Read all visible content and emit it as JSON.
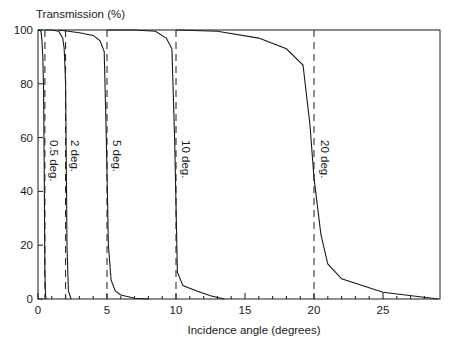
{
  "chart_data": {
    "type": "line",
    "title": "",
    "ylabel": "Transmission (%)",
    "xlabel": "Incidence angle (degrees)",
    "xlim": [
      0,
      29
    ],
    "ylim": [
      0,
      100
    ],
    "xticks": [
      0,
      5,
      10,
      15,
      20,
      25
    ],
    "yticks": [
      0,
      20,
      40,
      60,
      80,
      100
    ],
    "grid": false,
    "legend": "inline rotated labels next to dashed cutoff lines",
    "series": [
      {
        "name": "0.5 deg.",
        "cutoff": 0.5,
        "x": [
          0,
          0.1,
          0.2,
          0.25,
          0.3,
          0.35,
          0.4,
          0.45,
          0.5,
          0.55,
          0.6
        ],
        "y": [
          100,
          100,
          99.5,
          98,
          95,
          90,
          80,
          50,
          10,
          1,
          0
        ]
      },
      {
        "name": "2 deg.",
        "cutoff": 2,
        "x": [
          0.5,
          1.0,
          1.5,
          1.8,
          1.9,
          2.0,
          2.05,
          2.1,
          2.2,
          2.4
        ],
        "y": [
          100,
          100,
          99.5,
          97,
          93,
          80,
          50,
          20,
          3,
          0
        ]
      },
      {
        "name": "5 deg.",
        "cutoff": 5,
        "x": [
          1.5,
          3.0,
          4.0,
          4.5,
          4.8,
          4.95,
          5.1,
          5.3,
          5.6,
          6.0,
          7.0,
          8.0
        ],
        "y": [
          100,
          99,
          98,
          96,
          92,
          60,
          20,
          7,
          3,
          1.5,
          0.3,
          0
        ]
      },
      {
        "name": "10 deg.",
        "cutoff": 10,
        "x": [
          5,
          7,
          8.5,
          9.3,
          9.7,
          9.9,
          10.1,
          10.5,
          11.5,
          12.5,
          13.5
        ],
        "y": [
          100,
          100,
          99.5,
          97,
          93,
          60,
          10,
          5,
          3,
          1.2,
          0
        ]
      },
      {
        "name": "20 deg.",
        "cutoff": 20,
        "x": [
          10,
          13,
          16,
          18,
          19.2,
          19.7,
          20.0,
          20.5,
          21.0,
          22.0,
          25.0,
          29.0
        ],
        "y": [
          100,
          99.5,
          97,
          93,
          87,
          65,
          45,
          24,
          13,
          7.5,
          2.5,
          0
        ]
      }
    ],
    "reference_lines": [
      {
        "x": 0.5,
        "style": "dashed"
      },
      {
        "x": 2,
        "style": "dashed"
      },
      {
        "x": 5,
        "style": "dashed"
      },
      {
        "x": 10,
        "style": "dashed"
      },
      {
        "x": 20,
        "style": "dashed"
      }
    ],
    "annotations": [
      "0.5 deg.",
      "2 deg.",
      "5 deg.",
      "10 deg.",
      "20 deg."
    ]
  },
  "labels": {
    "ylabel": "Transmission (%)",
    "xlabel": "Incidence angle (degrees)",
    "y_ticks": [
      "0",
      "20",
      "40",
      "60",
      "80",
      "100"
    ],
    "x_ticks": [
      "0",
      "5",
      "10",
      "15",
      "20",
      "25"
    ],
    "curve_labels": [
      "0.5 deg.",
      "2 deg.",
      "5 deg.",
      "10 deg.",
      "20 deg."
    ]
  }
}
